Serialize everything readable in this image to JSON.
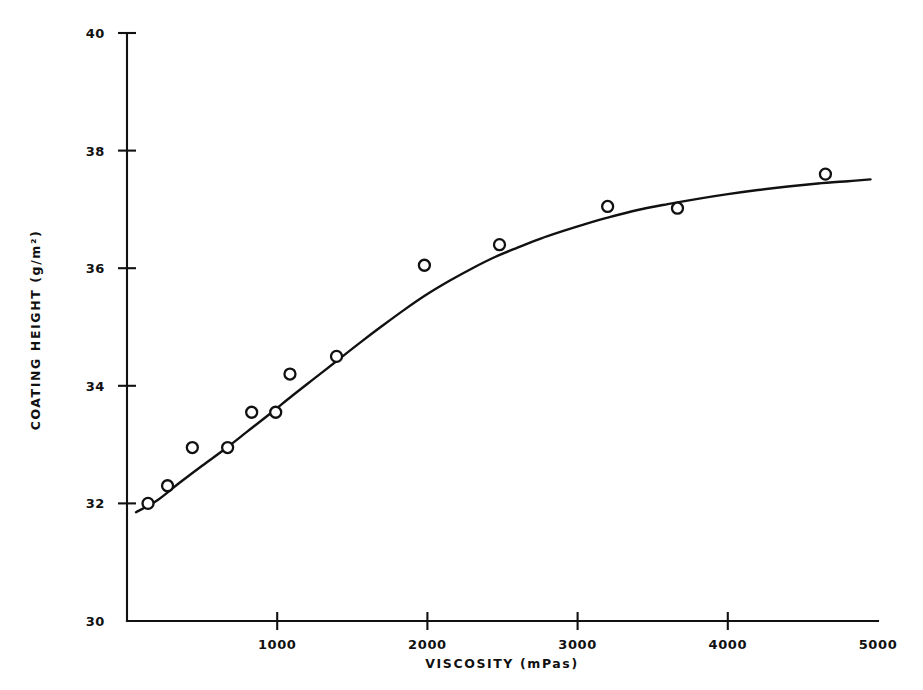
{
  "chart_data": {
    "type": "scatter",
    "title": "",
    "subtitle": "",
    "xlabel": "VISCOSITY (mPas)",
    "ylabel": "COATING HEIGHT (g/m²)",
    "xlim": [
      0,
      5000
    ],
    "ylim": [
      30,
      40
    ],
    "xticks": [
      1000,
      2000,
      3000,
      4000,
      5000
    ],
    "xtick_labels": [
      "1000",
      "2000",
      "3000",
      "4000",
      "5000"
    ],
    "yticks": [
      30,
      32,
      34,
      36,
      38,
      40
    ],
    "ytick_labels": [
      "30",
      "32",
      "34",
      "36",
      "38",
      "40"
    ],
    "grid": false,
    "legend": false,
    "marker": "open-circle",
    "marker_size": 11,
    "line_color": "#111111",
    "marker_color": "#111111",
    "axis_color": "#111111",
    "background": "#ffffff",
    "points": [
      {
        "x": 140,
        "y": 32.0
      },
      {
        "x": 270,
        "y": 32.3
      },
      {
        "x": 435,
        "y": 32.95
      },
      {
        "x": 670,
        "y": 32.95
      },
      {
        "x": 830,
        "y": 33.55
      },
      {
        "x": 990,
        "y": 33.55
      },
      {
        "x": 1085,
        "y": 34.2
      },
      {
        "x": 1395,
        "y": 34.5
      },
      {
        "x": 1980,
        "y": 36.05
      },
      {
        "x": 2480,
        "y": 36.4
      },
      {
        "x": 3200,
        "y": 37.05
      },
      {
        "x": 3665,
        "y": 37.02
      },
      {
        "x": 4650,
        "y": 37.6
      }
    ],
    "fit_curve": [
      {
        "x": 60,
        "y": 31.85
      },
      {
        "x": 200,
        "y": 32.05
      },
      {
        "x": 350,
        "y": 32.35
      },
      {
        "x": 500,
        "y": 32.64
      },
      {
        "x": 650,
        "y": 32.92
      },
      {
        "x": 800,
        "y": 33.22
      },
      {
        "x": 950,
        "y": 33.52
      },
      {
        "x": 1100,
        "y": 33.83
      },
      {
        "x": 1250,
        "y": 34.13
      },
      {
        "x": 1400,
        "y": 34.43
      },
      {
        "x": 1550,
        "y": 34.73
      },
      {
        "x": 1700,
        "y": 35.02
      },
      {
        "x": 1850,
        "y": 35.3
      },
      {
        "x": 2000,
        "y": 35.56
      },
      {
        "x": 2150,
        "y": 35.79
      },
      {
        "x": 2300,
        "y": 36.0
      },
      {
        "x": 2450,
        "y": 36.19
      },
      {
        "x": 2600,
        "y": 36.35
      },
      {
        "x": 2750,
        "y": 36.5
      },
      {
        "x": 2900,
        "y": 36.63
      },
      {
        "x": 3050,
        "y": 36.75
      },
      {
        "x": 3200,
        "y": 36.86
      },
      {
        "x": 3400,
        "y": 36.99
      },
      {
        "x": 3600,
        "y": 37.09
      },
      {
        "x": 3800,
        "y": 37.18
      },
      {
        "x": 4000,
        "y": 37.26
      },
      {
        "x": 4200,
        "y": 37.33
      },
      {
        "x": 4400,
        "y": 37.39
      },
      {
        "x": 4600,
        "y": 37.44
      },
      {
        "x": 4800,
        "y": 37.48
      },
      {
        "x": 4950,
        "y": 37.51
      }
    ]
  }
}
